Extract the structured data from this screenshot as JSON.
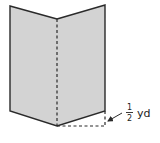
{
  "figure": {
    "colors": {
      "fill": "#d3d3d3",
      "stroke": "#2a2a2a",
      "text": "#222222",
      "background": "#ffffff"
    }
  },
  "label": {
    "numerator": "1",
    "denominator": "2",
    "unit": "yd",
    "full_text": "1/2 yd"
  }
}
